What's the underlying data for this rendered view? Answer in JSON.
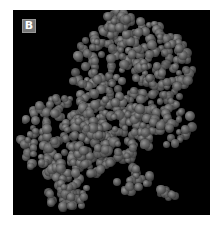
{
  "figure": {
    "panel_label": "B",
    "colors": {
      "background": "#000000",
      "atom": "#6c6c6c",
      "label_bg": "#777777",
      "label_text": "#ffffff"
    },
    "clusters": [
      {
        "cx": 120,
        "cy": 60,
        "rx": 62,
        "ry": 50,
        "count": 260
      },
      {
        "cx": 105,
        "cy": 10,
        "rx": 14,
        "ry": 10,
        "count": 20
      },
      {
        "cx": 55,
        "cy": 130,
        "rx": 48,
        "ry": 45,
        "count": 220
      },
      {
        "cx": 100,
        "cy": 120,
        "rx": 40,
        "ry": 35,
        "count": 120
      },
      {
        "cx": 150,
        "cy": 115,
        "rx": 30,
        "ry": 25,
        "count": 60
      },
      {
        "cx": 55,
        "cy": 185,
        "rx": 22,
        "ry": 14,
        "count": 35
      },
      {
        "cx": 120,
        "cy": 170,
        "rx": 18,
        "ry": 12,
        "count": 20
      },
      {
        "cx": 153,
        "cy": 186,
        "rx": 10,
        "ry": 8,
        "count": 10
      }
    ]
  }
}
